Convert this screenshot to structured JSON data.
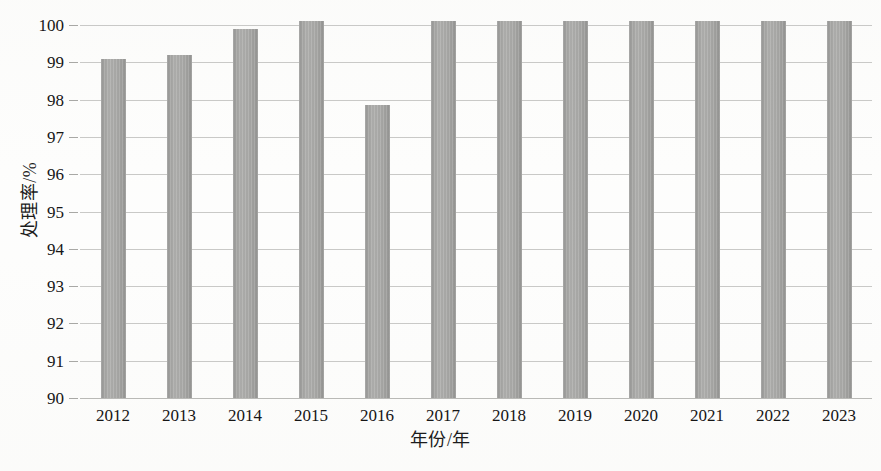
{
  "chart_data": {
    "type": "bar",
    "title": "",
    "xlabel": "年份/年",
    "ylabel": "处理率/%",
    "categories": [
      "2012",
      "2013",
      "2014",
      "2015",
      "2016",
      "2017",
      "2018",
      "2019",
      "2020",
      "2021",
      "2022",
      "2023"
    ],
    "values": [
      99.1,
      99.2,
      99.9,
      100.1,
      97.85,
      100.1,
      100.1,
      100.1,
      100.1,
      100.1,
      100.1,
      100.1
    ],
    "series": [
      {
        "name": "处理率",
        "values": [
          99.1,
          99.2,
          99.9,
          100.1,
          97.85,
          100.1,
          100.1,
          100.1,
          100.1,
          100.1,
          100.1,
          100.1
        ]
      }
    ],
    "ylim": [
      90,
      100
    ],
    "ytick_labels": [
      "100",
      "99",
      "98",
      "97",
      "96",
      "95",
      "94",
      "93",
      "92",
      "91",
      "90"
    ],
    "ytick_values": [
      100,
      99,
      98,
      97,
      96,
      95,
      94,
      93,
      92,
      91,
      90
    ],
    "ytick_step": 1,
    "grid": true,
    "grid_axis": "y",
    "legend": false,
    "legend_position": "none",
    "bar_color": "#a8a8a6",
    "grid_color": "#c9c9c7",
    "background_color": "#fdfdfc",
    "annotations": []
  }
}
